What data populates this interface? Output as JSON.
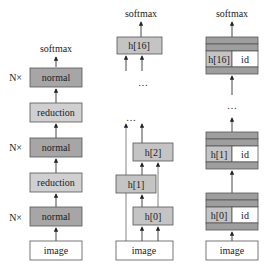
{
  "colors": {
    "normal": "#a6a6a6",
    "reduction": "#d0d0d0",
    "hidden": "#c4c4c4",
    "band": "#9e9e9e",
    "white": "#ffffff",
    "stroke": "#555555"
  },
  "columns": [
    {
      "name": "stacked-cells",
      "output_label": "softmax",
      "input_label": "image",
      "blocks": [
        {
          "label": "normal",
          "type": "normal",
          "repeat_label": "N×"
        },
        {
          "label": "reduction",
          "type": "reduction"
        },
        {
          "label": "normal",
          "type": "normal",
          "repeat_label": "N×"
        },
        {
          "label": "reduction",
          "type": "reduction"
        },
        {
          "label": "normal",
          "type": "normal",
          "repeat_label": "N×"
        }
      ]
    },
    {
      "name": "dense-hidden-states",
      "output_label": "softmax",
      "input_label": "image",
      "nodes": [
        "h[0]",
        "h[1]",
        "h[2]",
        "h[16]"
      ],
      "ellipsis": [
        "…",
        "…"
      ]
    },
    {
      "name": "hidden-with-identity",
      "output_label": "softmax",
      "input_label": "image",
      "nodes": [
        {
          "left": "h[0]",
          "right": "id"
        },
        {
          "left": "h[1]",
          "right": "id"
        },
        {
          "left": "h[16]",
          "right": "id"
        }
      ],
      "ellipsis": "…"
    }
  ]
}
